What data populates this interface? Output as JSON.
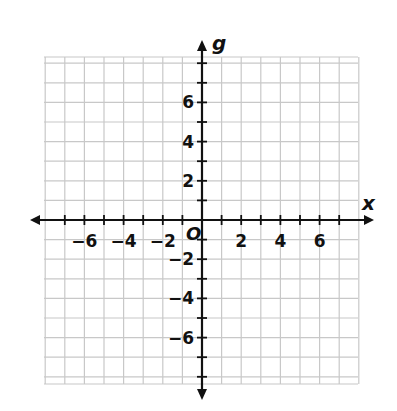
{
  "header": {
    "text": "(a) ... "
  },
  "chart_data": {
    "type": "scatter",
    "title": "",
    "xlabel": "x",
    "ylabel": "g",
    "xlim": [
      -8,
      8
    ],
    "ylim": [
      -8,
      8
    ],
    "grid": true,
    "x_ticks": [
      -6,
      -4,
      -2,
      2,
      4,
      6
    ],
    "y_ticks": [
      6,
      4,
      2,
      -2,
      -4,
      -6
    ],
    "origin_label": "O",
    "series": []
  },
  "colors": {
    "grid": "#c8c8c8",
    "axis": "#111111"
  }
}
